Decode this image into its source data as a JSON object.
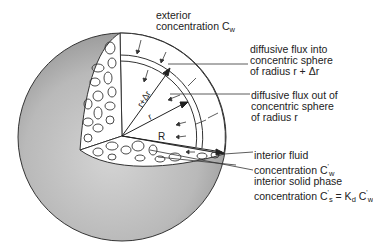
{
  "diagram": {
    "labels": {
      "exterior": {
        "line1": "exterior",
        "line2": "concentration C",
        "sub": "w"
      },
      "flux_in": {
        "line1": "diffusive flux into",
        "line2": "concentric sphere",
        "line3": "of radius r + Δr"
      },
      "flux_out": {
        "line1": "diffusive flux out of",
        "line2": "concentric sphere",
        "line3": "of radius r"
      },
      "interior_fluid": {
        "line1": "interior fluid",
        "line2": "concentration C",
        "sup": "'",
        "sub": "w"
      },
      "interior_solid": {
        "line1": "interior solid phase",
        "line2a": "concentration C",
        "sup_s": "'",
        "sub_s": "s",
        "eq": " = K",
        "sub_d": "d",
        "line2b": " C",
        "sup_w": "'",
        "sub_w": "w"
      }
    },
    "radius_labels": {
      "r_plus_dr": "r+Δr",
      "r": "r",
      "R": "R"
    },
    "colors": {
      "shell_gray": "#b8b8b8",
      "shell_dark": "#9a9a9a",
      "line": "#333333",
      "background": "#ffffff"
    }
  }
}
